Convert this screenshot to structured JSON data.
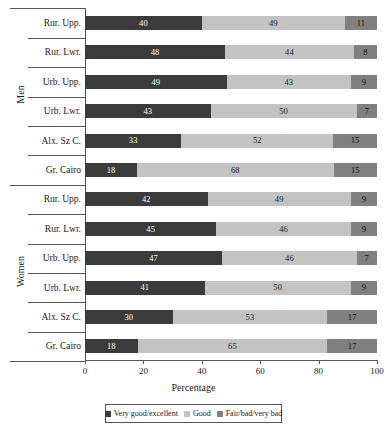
{
  "chart_data": {
    "type": "bar",
    "subtype": "stacked-horizontal-100-percent",
    "title": "",
    "xlabel": "Percentage",
    "ylabel": "",
    "xlim": [
      0,
      100
    ],
    "xticks": [
      0,
      20,
      40,
      60,
      80,
      100
    ],
    "grid": false,
    "legend_position": "bottom",
    "categories": [
      "Rur. Upp.",
      "Rur. Lwr.",
      "Urb. Upp.",
      "Urb. Lwr.",
      "Alx. Sz C.",
      "Gr. Cairo",
      "Rur. Upp.",
      "Rur. Lwr.",
      "Urb. Upp.",
      "Urb. Lwr.",
      "Alx. Sz C.",
      "Gr. Cairo"
    ],
    "groups": [
      {
        "name": "Men",
        "categories": [
          "Rur. Upp.",
          "Rur. Lwr.",
          "Urb. Upp.",
          "Urb. Lwr.",
          "Alx. Sz C.",
          "Gr. Cairo"
        ]
      },
      {
        "name": "Women",
        "categories": [
          "Rur. Upp.",
          "Rur. Lwr.",
          "Urb. Upp.",
          "Urb. Lwr.",
          "Alx. Sz C.",
          "Gr. Cairo"
        ]
      }
    ],
    "series": [
      {
        "name": "Very good/excellent",
        "color": "#3b3b3b",
        "values": [
          40,
          48,
          49,
          43,
          33,
          18,
          42,
          45,
          47,
          41,
          30,
          18
        ]
      },
      {
        "name": "Good",
        "color": "#c2c3c2",
        "values": [
          49,
          44,
          43,
          50,
          52,
          68,
          49,
          46,
          46,
          50,
          53,
          65
        ]
      },
      {
        "name": "Fair/bad/very bad",
        "color": "#808080",
        "values": [
          11,
          8,
          9,
          7,
          15,
          15,
          9,
          9,
          7,
          9,
          17,
          17
        ]
      }
    ],
    "rows": [
      {
        "group": "Men",
        "category": "Rur. Upp.",
        "values": [
          40,
          49,
          11
        ]
      },
      {
        "group": "Men",
        "category": "Rur. Lwr.",
        "values": [
          48,
          44,
          8
        ]
      },
      {
        "group": "Men",
        "category": "Urb. Upp.",
        "values": [
          49,
          43,
          9
        ]
      },
      {
        "group": "Men",
        "category": "Urb. Lwr.",
        "values": [
          43,
          50,
          7
        ]
      },
      {
        "group": "Men",
        "category": "Alx. Sz C.",
        "values": [
          33,
          52,
          15
        ]
      },
      {
        "group": "Men",
        "category": "Gr. Cairo",
        "values": [
          18,
          68,
          15
        ]
      },
      {
        "group": "Women",
        "category": "Rur. Upp.",
        "values": [
          42,
          49,
          9
        ]
      },
      {
        "group": "Women",
        "category": "Rur. Lwr.",
        "values": [
          45,
          46,
          9
        ]
      },
      {
        "group": "Women",
        "category": "Urb. Upp.",
        "values": [
          47,
          46,
          7
        ]
      },
      {
        "group": "Women",
        "category": "Urb. Lwr.",
        "values": [
          41,
          50,
          9
        ]
      },
      {
        "group": "Women",
        "category": "Alx. Sz C.",
        "values": [
          30,
          53,
          17
        ]
      },
      {
        "group": "Women",
        "category": "Gr. Cairo",
        "values": [
          18,
          65,
          17
        ]
      }
    ],
    "legend": [
      {
        "label": "Very good/excellent",
        "color": "#3b3b3b"
      },
      {
        "label": "Good",
        "color": "#c2c3c2"
      },
      {
        "label": "Fair/bad/very bad",
        "color": "#808080"
      }
    ]
  }
}
